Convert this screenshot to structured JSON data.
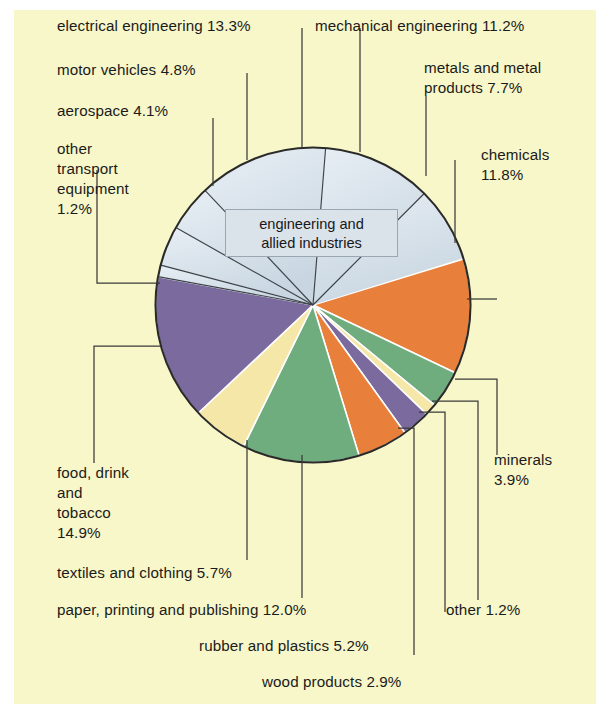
{
  "figure": {
    "background_color": "#f8f7c9",
    "outer_color": "#ffffff",
    "center_box_label": "engineering and\nallied industries",
    "center_box_line1": "engineering and",
    "center_box_line2": "allied industries"
  },
  "chart_data": {
    "type": "pie",
    "title": "",
    "subtitle": "",
    "center_label": "engineering and allied industries",
    "units": "%",
    "total": 100.0,
    "legend_position": "callout-labels",
    "grid": false,
    "categories": [
      "chemicals",
      "minerals",
      "other",
      "wood products",
      "rubber and plastics",
      "paper, printing and publishing",
      "textiles and clothing",
      "food, drink and tobacco",
      "other transport equipment",
      "aerospace",
      "motor vehicles",
      "electrical engineering",
      "mechanical engineering",
      "metals and metal products"
    ],
    "values": [
      11.8,
      3.9,
      1.2,
      2.9,
      5.2,
      12.0,
      5.7,
      14.9,
      1.2,
      4.1,
      4.8,
      13.3,
      11.2,
      7.7
    ],
    "colors": [
      "#e8803c",
      "#6fad7e",
      "#f4e7a8",
      "#7b6a9e",
      "#e8803c",
      "#6fad7e",
      "#f4e7a8",
      "#7b6a9e",
      "#dde6ee",
      "#dde6ee",
      "#dde6ee",
      "#dde6ee",
      "#dde6ee",
      "#dde6ee"
    ],
    "group": {
      "name": "engineering and allied industries",
      "members": [
        "metals and metal products",
        "mechanical engineering",
        "electrical engineering",
        "motor vehicles",
        "aerospace",
        "other transport equipment"
      ],
      "total": 42.3,
      "color": "#dde6ee"
    },
    "labels": [
      {
        "key": "electrical_engineering",
        "text": "electrical engineering 13.3%",
        "value": 13.3
      },
      {
        "key": "mechanical_engineering",
        "text": "mechanical engineering 11.2%",
        "value": 11.2
      },
      {
        "key": "motor_vehicles",
        "text": "motor vehicles 4.8%",
        "value": 4.8
      },
      {
        "key": "metals_and_metal_products",
        "text": "metals and metal\nproducts 7.7%",
        "value": 7.7
      },
      {
        "key": "aerospace",
        "text": "aerospace 4.1%",
        "value": 4.1
      },
      {
        "key": "chemicals",
        "text": "chemicals\n11.8%",
        "value": 11.8
      },
      {
        "key": "other_transport_equipment",
        "text": "other\ntransport\nequipment\n1.2%",
        "value": 1.2
      },
      {
        "key": "minerals",
        "text": "minerals\n3.9%",
        "value": 3.9
      },
      {
        "key": "food_drink_and_tobacco",
        "text": "food, drink\nand\ntobacco\n14.9%",
        "value": 14.9
      },
      {
        "key": "textiles_and_clothing",
        "text": "textiles and clothing 5.7%",
        "value": 5.7
      },
      {
        "key": "paper_printing_and_publishing",
        "text": "paper, printing and publishing 12.0%",
        "value": 12.0
      },
      {
        "key": "other",
        "text": "other 1.2%",
        "value": 1.2
      },
      {
        "key": "rubber_and_plastics",
        "text": "rubber and plastics 5.2%",
        "value": 5.2
      },
      {
        "key": "wood_products",
        "text": "wood products 2.9%",
        "value": 2.9
      }
    ]
  },
  "callouts": {
    "electrical_engineering": "electrical engineering 13.3%",
    "mechanical_engineering": "mechanical engineering 11.2%",
    "motor_vehicles": "motor vehicles 4.8%",
    "metals_line1": "metals and metal",
    "metals_line2": "products 7.7%",
    "aerospace": "aerospace 4.1%",
    "chemicals_line1": "chemicals",
    "chemicals_line2": "11.8%",
    "ote_line1": "other",
    "ote_line2": "transport",
    "ote_line3": "equipment",
    "ote_line4": "1.2%",
    "minerals_line1": "minerals",
    "minerals_line2": "3.9%",
    "food_line1": "food, drink",
    "food_line2": "and",
    "food_line3": "tobacco",
    "food_line4": "14.9%",
    "textiles": "textiles and clothing 5.7%",
    "paper": "paper, printing and publishing 12.0%",
    "other": "other 1.2%",
    "rubber": "rubber and plastics 5.2%",
    "wood": "wood products 2.9%"
  }
}
